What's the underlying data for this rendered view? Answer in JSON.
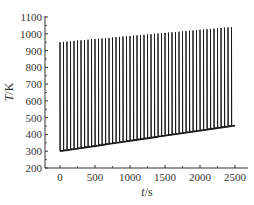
{
  "chart_data": {
    "type": "line",
    "title": "",
    "xlabel": "t/s",
    "ylabel": "T/K",
    "xlabel_var": "t",
    "xlabel_unit": "/s",
    "ylabel_var": "T",
    "ylabel_unit": "/K",
    "xlim": [
      -100,
      2700
    ],
    "ylim": [
      200,
      1100
    ],
    "x_ticks": [
      0,
      500,
      1000,
      1500,
      2000,
      2500
    ],
    "y_ticks": [
      200,
      300,
      400,
      500,
      600,
      700,
      800,
      900,
      1000,
      1100
    ],
    "grid": false,
    "legend": null,
    "series": [
      {
        "name": "Temperature",
        "description": "Periodic thermal cycling: ~50 sharp spikes, peak temperature rising linearly from ~950 K to ~1040 K, baseline rising from ~300 K to ~450 K",
        "pulse_count": 50,
        "period_s": 50,
        "t_start": 0,
        "t_end": 2450,
        "peak_start": 950,
        "peak_end": 1040,
        "base_start": 300,
        "base_end": 450
      }
    ],
    "color": "#1a1a1a"
  }
}
